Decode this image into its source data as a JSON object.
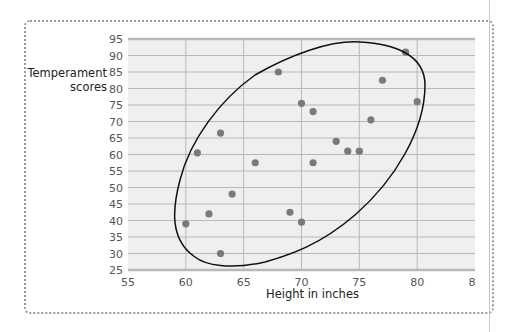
{
  "chart_data": {
    "type": "scatter",
    "title": "",
    "xlabel": "Height in inches",
    "ylabel": "Temperament scores",
    "ylabel_lines": [
      "Temperament",
      "scores"
    ],
    "xlim": [
      55,
      85
    ],
    "ylim": [
      25,
      95
    ],
    "x_ticks": [
      "55",
      "60",
      "65",
      "70",
      "75",
      "80",
      "8"
    ],
    "y_ticks": [
      "25",
      "30",
      "35",
      "40",
      "45",
      "50",
      "55",
      "60",
      "65",
      "70",
      "75",
      "80",
      "85",
      "90",
      "95"
    ],
    "grid": true,
    "legend": null,
    "annotations": [
      "ellipse enclosing data points indicating positive correlation"
    ],
    "points": [
      {
        "x": 60,
        "y": 39
      },
      {
        "x": 61,
        "y": 60.5
      },
      {
        "x": 62,
        "y": 42
      },
      {
        "x": 63,
        "y": 30
      },
      {
        "x": 63,
        "y": 66.5
      },
      {
        "x": 64,
        "y": 48
      },
      {
        "x": 66,
        "y": 57.5
      },
      {
        "x": 68,
        "y": 85
      },
      {
        "x": 69,
        "y": 42.5
      },
      {
        "x": 70,
        "y": 39.5
      },
      {
        "x": 70,
        "y": 75.5
      },
      {
        "x": 71,
        "y": 73
      },
      {
        "x": 71,
        "y": 57.5
      },
      {
        "x": 73,
        "y": 64
      },
      {
        "x": 74,
        "y": 61
      },
      {
        "x": 75,
        "y": 61
      },
      {
        "x": 76,
        "y": 70.5
      },
      {
        "x": 77,
        "y": 82.5
      },
      {
        "x": 79,
        "y": 91
      },
      {
        "x": 80,
        "y": 76
      }
    ]
  },
  "colors": {
    "plot_bg": "#efefef",
    "grid": "#b8b8b8",
    "point": "#7a7a7a",
    "ellipse": "#111111",
    "frame": "#9a9a9a"
  }
}
